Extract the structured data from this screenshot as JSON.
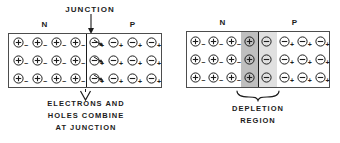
{
  "figure": {
    "title_left": "JUNCTION",
    "panels": [
      {
        "id": "forward-combination",
        "region_label_n": "N",
        "region_label_p": "P",
        "top_label": "JUNCTION",
        "caption_lines": [
          "ELECTRONS AND",
          "HOLES COMBINE",
          "AT JUNCTION"
        ],
        "columns": 8,
        "rows": 3,
        "junction_column_index": 4,
        "cells": [
          [
            "hole",
            "hole",
            "hole",
            "hole",
            "electron",
            "electron",
            "electron",
            "electron"
          ],
          [
            "hole",
            "hole",
            "hole",
            "hole",
            "electron",
            "electron",
            "electron",
            "electron"
          ],
          [
            "hole",
            "hole",
            "hole",
            "hole",
            "electron",
            "electron",
            "electron",
            "electron"
          ]
        ],
        "carrier_symbols": {
          "hole": {
            "core": "+",
            "subscript": "−"
          },
          "electron": {
            "core": "−",
            "subscript": "+"
          }
        },
        "has_junction_arrow": true,
        "has_flow_arrows": true
      },
      {
        "id": "depletion-region",
        "region_label_n": "N",
        "region_label_p": "P",
        "top_label": "",
        "caption_lines": [
          "DEPLETION",
          "REGION"
        ],
        "columns": 8,
        "rows": 3,
        "junction_column_index": 4,
        "depletion_columns": [
          3,
          4
        ],
        "cells": [
          [
            "hole",
            "hole",
            "hole",
            "ion_pos",
            "ion_neg",
            "electron",
            "electron",
            "electron"
          ],
          [
            "hole",
            "hole",
            "hole",
            "ion_pos",
            "ion_neg",
            "electron",
            "electron",
            "electron"
          ],
          [
            "hole",
            "hole",
            "hole",
            "ion_pos",
            "ion_neg",
            "electron",
            "electron",
            "electron"
          ]
        ],
        "carrier_symbols": {
          "hole": {
            "core": "+",
            "subscript": "−"
          },
          "electron": {
            "core": "−",
            "subscript": "+"
          },
          "ion_pos": {
            "core": "+",
            "subscript": ""
          },
          "ion_neg": {
            "core": "−",
            "subscript": ""
          }
        },
        "has_junction_arrow": false,
        "has_brace": true
      }
    ]
  },
  "colors": {
    "outline": "#4d4d4d",
    "text": "#1c1c1c",
    "depletion_n_shade": "#bfbfbf",
    "depletion_p_shade": "#e0e0e0",
    "background": "#ffffff"
  }
}
